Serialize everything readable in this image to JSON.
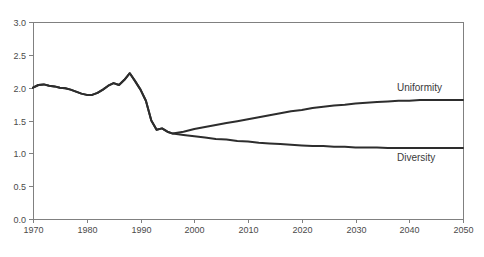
{
  "chart_data": {
    "type": "line",
    "title": "",
    "xlabel": "",
    "ylabel": "",
    "xlim": [
      1970,
      2050
    ],
    "ylim": [
      0.0,
      3.0
    ],
    "grid": false,
    "legend_position": "inline-annotations",
    "x_ticks": [
      {
        "label": "1970",
        "value": 1970
      },
      {
        "label": "1980",
        "value": 1980
      },
      {
        "label": "1990",
        "value": 1990
      },
      {
        "label": "2000",
        "value": 2000
      },
      {
        "label": "2010",
        "value": 2010
      },
      {
        "label": "2020",
        "value": 2020
      },
      {
        "label": "2030",
        "value": 2030
      },
      {
        "label": "2040",
        "value": 2040
      },
      {
        "label": "2050",
        "value": 2050
      }
    ],
    "y_ticks": [
      {
        "label": "0.0",
        "value": 0.0
      },
      {
        "label": "0.5",
        "value": 0.5
      },
      {
        "label": "1.0",
        "value": 1.0
      },
      {
        "label": "1.5",
        "value": 1.5
      },
      {
        "label": "2.0",
        "value": 2.0
      },
      {
        "label": "2.5",
        "value": 2.5
      },
      {
        "label": "3.0",
        "value": 3.0
      }
    ],
    "colors": {
      "line": "#2d2d2d",
      "frame": "#808080",
      "tick_label": "#4a4a4a",
      "background": "#ffffff"
    },
    "series": [
      {
        "name": "Uniformity",
        "points": [
          [
            1970,
            2.0
          ],
          [
            1971,
            2.04
          ],
          [
            1972,
            2.05
          ],
          [
            1973,
            2.03
          ],
          [
            1974,
            2.02
          ],
          [
            1975,
            2.0
          ],
          [
            1976,
            1.99
          ],
          [
            1977,
            1.97
          ],
          [
            1978,
            1.94
          ],
          [
            1979,
            1.91
          ],
          [
            1980,
            1.89
          ],
          [
            1981,
            1.89
          ],
          [
            1982,
            1.92
          ],
          [
            1983,
            1.97
          ],
          [
            1984,
            2.03
          ],
          [
            1985,
            2.07
          ],
          [
            1986,
            2.04
          ],
          [
            1987,
            2.12
          ],
          [
            1988,
            2.22
          ],
          [
            1989,
            2.1
          ],
          [
            1990,
            1.97
          ],
          [
            1991,
            1.8
          ],
          [
            1992,
            1.5
          ],
          [
            1993,
            1.36
          ],
          [
            1994,
            1.38
          ],
          [
            1995,
            1.33
          ],
          [
            1996,
            1.3
          ],
          [
            1998,
            1.33
          ],
          [
            2000,
            1.37
          ],
          [
            2002,
            1.4
          ],
          [
            2004,
            1.43
          ],
          [
            2006,
            1.46
          ],
          [
            2008,
            1.49
          ],
          [
            2010,
            1.52
          ],
          [
            2012,
            1.55
          ],
          [
            2014,
            1.58
          ],
          [
            2016,
            1.61
          ],
          [
            2018,
            1.64
          ],
          [
            2020,
            1.66
          ],
          [
            2022,
            1.69
          ],
          [
            2024,
            1.71
          ],
          [
            2026,
            1.73
          ],
          [
            2028,
            1.74
          ],
          [
            2030,
            1.76
          ],
          [
            2032,
            1.77
          ],
          [
            2034,
            1.78
          ],
          [
            2036,
            1.79
          ],
          [
            2038,
            1.8
          ],
          [
            2040,
            1.8
          ],
          [
            2042,
            1.81
          ],
          [
            2044,
            1.81
          ],
          [
            2046,
            1.81
          ],
          [
            2048,
            1.81
          ],
          [
            2050,
            1.81
          ]
        ]
      },
      {
        "name": "Diversity",
        "points": [
          [
            1970,
            2.0
          ],
          [
            1971,
            2.04
          ],
          [
            1972,
            2.05
          ],
          [
            1973,
            2.03
          ],
          [
            1974,
            2.02
          ],
          [
            1975,
            2.0
          ],
          [
            1976,
            1.99
          ],
          [
            1977,
            1.97
          ],
          [
            1978,
            1.94
          ],
          [
            1979,
            1.91
          ],
          [
            1980,
            1.89
          ],
          [
            1981,
            1.89
          ],
          [
            1982,
            1.92
          ],
          [
            1983,
            1.97
          ],
          [
            1984,
            2.03
          ],
          [
            1985,
            2.07
          ],
          [
            1986,
            2.04
          ],
          [
            1987,
            2.12
          ],
          [
            1988,
            2.22
          ],
          [
            1989,
            2.1
          ],
          [
            1990,
            1.97
          ],
          [
            1991,
            1.8
          ],
          [
            1992,
            1.5
          ],
          [
            1993,
            1.36
          ],
          [
            1994,
            1.38
          ],
          [
            1995,
            1.33
          ],
          [
            1996,
            1.3
          ],
          [
            1998,
            1.28
          ],
          [
            2000,
            1.26
          ],
          [
            2002,
            1.24
          ],
          [
            2004,
            1.22
          ],
          [
            2006,
            1.21
          ],
          [
            2008,
            1.19
          ],
          [
            2010,
            1.18
          ],
          [
            2012,
            1.16
          ],
          [
            2014,
            1.15
          ],
          [
            2016,
            1.14
          ],
          [
            2018,
            1.13
          ],
          [
            2020,
            1.12
          ],
          [
            2022,
            1.11
          ],
          [
            2024,
            1.11
          ],
          [
            2026,
            1.1
          ],
          [
            2028,
            1.1
          ],
          [
            2030,
            1.09
          ],
          [
            2032,
            1.09
          ],
          [
            2034,
            1.09
          ],
          [
            2036,
            1.08
          ],
          [
            2038,
            1.08
          ],
          [
            2040,
            1.08
          ],
          [
            2042,
            1.08
          ],
          [
            2044,
            1.08
          ],
          [
            2046,
            1.08
          ],
          [
            2048,
            1.08
          ],
          [
            2050,
            1.08
          ]
        ]
      }
    ]
  }
}
